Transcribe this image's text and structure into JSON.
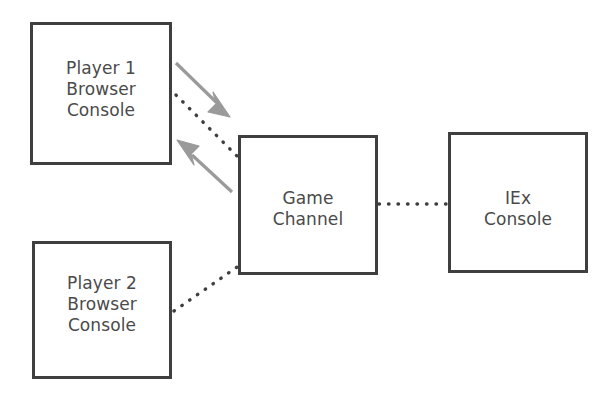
{
  "diagram": {
    "background_color": "#ffffff",
    "box_border_color": "#3f3f3f",
    "text_color": "#4a4a4a",
    "arrow_color": "#9a9a9a",
    "dotted_line_color": "#3f3f3f",
    "nodes": [
      {
        "id": "player1",
        "label": "Player 1\nBrowser\nConsole",
        "line1": "Player 1",
        "line2": "Browser",
        "line3": "Console",
        "x": 30,
        "y": 22,
        "width": 142,
        "height": 143
      },
      {
        "id": "player2",
        "label": "Player 2\nBrowser\nConsole",
        "line1": "Player 2",
        "line2": "Browser",
        "line3": "Console",
        "x": 32,
        "y": 241,
        "width": 140,
        "height": 138
      },
      {
        "id": "gamechannel",
        "label": "Game\nChannel",
        "line1": "Game",
        "line2": "Channel",
        "x": 238,
        "y": 135,
        "width": 140,
        "height": 140
      },
      {
        "id": "iexconsole",
        "label": "IEx\nConsole",
        "line1": "IEx",
        "line2": "Console",
        "x": 448,
        "y": 132,
        "width": 140,
        "height": 141
      }
    ],
    "edges": [
      {
        "id": "player1-gamechannel-dotted",
        "from": "player1",
        "to": "gamechannel",
        "style": "dotted",
        "color": "#3f3f3f"
      },
      {
        "id": "player2-gamechannel-dotted",
        "from": "player2",
        "to": "gamechannel",
        "style": "dotted",
        "color": "#3f3f3f"
      },
      {
        "id": "gamechannel-iexconsole-dotted",
        "from": "gamechannel",
        "to": "iexconsole",
        "style": "dotted",
        "color": "#3f3f3f"
      }
    ],
    "arrows": [
      {
        "id": "arrow-outbound",
        "direction": "down-right",
        "from": "player1",
        "to": "gamechannel",
        "color": "#9a9a9a"
      },
      {
        "id": "arrow-inbound",
        "direction": "up-left",
        "from": "gamechannel",
        "to": "player1",
        "color": "#9a9a9a"
      }
    ]
  }
}
